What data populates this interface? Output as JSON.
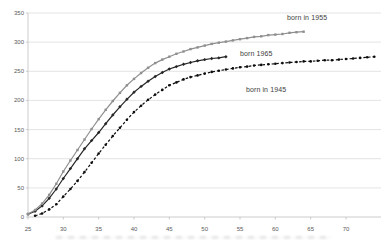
{
  "chart_data": {
    "type": "line",
    "title": "",
    "xlabel": "",
    "ylabel": "",
    "grid": "horizontal",
    "legend_position": "none",
    "x_axis": {
      "min": 25,
      "max": 75,
      "ticks": [
        25,
        30,
        35,
        40,
        45,
        50,
        55,
        60,
        65,
        70
      ]
    },
    "y_axis": {
      "min": 0,
      "max": 350,
      "ticks": [
        0,
        50,
        100,
        150,
        200,
        250,
        300,
        350
      ]
    },
    "colors": {
      "background": "#ffffff",
      "gridline": "#d9d9d9",
      "axis": "#bfbfbf",
      "tick_text": "#595959",
      "annotation_text": "#3d3d3d"
    },
    "series": [
      {
        "name": "born in 1955",
        "color": "#8f8f8f",
        "marker": "square",
        "line_style": "solid",
        "age_start": 25,
        "x_step": 1,
        "values": [
          5,
          12,
          23,
          38,
          57,
          78,
          97,
          115,
          133,
          151,
          168,
          184,
          199,
          213,
          226,
          237,
          247,
          256,
          264,
          270,
          275,
          280,
          284,
          288,
          291,
          294,
          297,
          299,
          301,
          303,
          305,
          307,
          309,
          310,
          312,
          313,
          314,
          316,
          317,
          318
        ]
      },
      {
        "name": "born 1965",
        "color": "#262626",
        "marker": "diamond",
        "line_style": "solid",
        "age_start": 25,
        "x_step": 1,
        "values": [
          5,
          10,
          19,
          32,
          48,
          66,
          83,
          100,
          117,
          131,
          145,
          160,
          175,
          189,
          202,
          214,
          224,
          233,
          241,
          248,
          254,
          258,
          262,
          265,
          268,
          270,
          272,
          273,
          275
        ]
      },
      {
        "name": "born in 1945",
        "color": "#0d0d0d",
        "marker": "circle",
        "line_style": "dashed",
        "age_start": 26,
        "x_step": 1,
        "values": [
          2,
          6,
          13,
          22,
          35,
          48,
          62,
          77,
          93,
          109,
          124,
          139,
          153,
          167,
          180,
          191,
          201,
          210,
          218,
          226,
          231,
          236,
          240,
          243,
          246,
          249,
          251,
          253,
          255,
          257,
          258,
          260,
          261,
          262,
          263,
          264,
          265,
          266,
          267,
          267,
          268,
          269,
          269,
          270,
          271,
          272,
          273,
          274,
          275
        ]
      }
    ],
    "annotations": [
      {
        "text": "born in 1955",
        "x_px": 287,
        "y_px": 14
      },
      {
        "text": "born 1965",
        "x_px": 240,
        "y_px": 50
      },
      {
        "text": "born in 1945",
        "x_px": 246,
        "y_px": 86
      }
    ]
  }
}
